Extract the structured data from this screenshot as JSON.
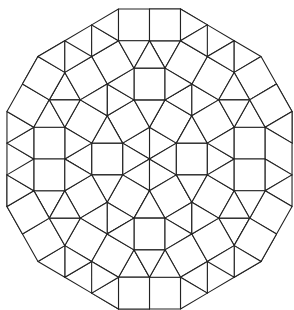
{
  "diagram": {
    "title": "",
    "canvas": {
      "width": 294,
      "height": 310,
      "background": "#ffffff"
    },
    "style": {
      "stroke": "#222222",
      "stroke_width": 1.1,
      "fill": "#ffffff"
    },
    "geometry": {
      "center": [
        149.5,
        159
      ],
      "edge_scale_x": 31,
      "edge_scale_y": 31.7,
      "symmetry_rotations": 6,
      "rotation_step_deg": 60
    },
    "points": {
      "O0": [
        0,
        0
      ],
      "V30": [
        0.866,
        0.5
      ],
      "V90": [
        0,
        1
      ],
      "P": [
        0.5,
        1.866
      ],
      "Pp": [
        -0.5,
        1.866
      ],
      "Q": [
        1.366,
        1.366
      ],
      "S": [
        1.866,
        0.5
      ],
      "H": [
        0.5,
        2.866
      ],
      "Hp": [
        -0.5,
        2.866
      ],
      "O": [
        2.732,
        1
      ],
      "J": [
        2.232,
        1.866
      ],
      "I": [
        1.366,
        2.366
      ],
      "D": [
        1.866,
        3.232
      ],
      "B": [
        1,
        3.732
      ],
      "F": [
        2.732,
        2.732
      ],
      "A": [
        1,
        4.732
      ],
      "T0": [
        0,
        3.732
      ],
      "T0A": [
        0,
        4.732
      ],
      "C": [
        1.866,
        4.232
      ],
      "E": [
        2.732,
        3.732
      ],
      "G": [
        3.598,
        3.232
      ],
      "K": [
        4.098,
        2.366
      ],
      "L": [
        3.232,
        1.866
      ],
      "M": [
        4.598,
        1.5
      ],
      "N": [
        3.732,
        1
      ],
      "T": [
        4.598,
        0.5
      ],
      "Np": [
        3.732,
        0
      ],
      "Op": [
        2.732,
        0
      ]
    },
    "wedge_tiles": [
      {
        "type": "triangle",
        "v": [
          "O0",
          "V30",
          "V90"
        ]
      },
      {
        "type": "square",
        "v": [
          "V90",
          "V30",
          "Q",
          "P"
        ]
      },
      {
        "type": "triangle",
        "v": [
          "V90",
          "P",
          "Pp"
        ]
      },
      {
        "type": "triangle",
        "v": [
          "V30",
          "S",
          "Q"
        ]
      },
      {
        "type": "square",
        "v": [
          "Pp",
          "P",
          "H",
          "Hp"
        ]
      },
      {
        "type": "square",
        "v": [
          "Q",
          "S",
          "O",
          "J"
        ]
      },
      {
        "type": "triangle",
        "v": [
          "P",
          "Q",
          "I"
        ]
      },
      {
        "type": "triangle",
        "v": [
          "H",
          "P",
          "I"
        ]
      },
      {
        "type": "triangle",
        "v": [
          "Q",
          "J",
          "I"
        ]
      },
      {
        "type": "square",
        "v": [
          "H",
          "I",
          "D",
          "B"
        ]
      },
      {
        "type": "square",
        "v": [
          "I",
          "J",
          "F",
          "D"
        ]
      },
      {
        "type": "triangle",
        "v": [
          "T0",
          "B",
          "H"
        ]
      },
      {
        "type": "triangle",
        "v": [
          "T0",
          "H",
          "Hp"
        ]
      },
      {
        "type": "square",
        "v": [
          "T0",
          "B",
          "A",
          "T0A"
        ]
      },
      {
        "type": "triangle",
        "v": [
          "A",
          "B",
          "C"
        ]
      },
      {
        "type": "square",
        "v": [
          "B",
          "D",
          "E",
          "C"
        ]
      },
      {
        "type": "triangle",
        "v": [
          "D",
          "E",
          "F"
        ]
      },
      {
        "type": "triangle",
        "v": [
          "E",
          "F",
          "G"
        ]
      },
      {
        "type": "square",
        "v": [
          "F",
          "G",
          "K",
          "L"
        ]
      },
      {
        "type": "triangle",
        "v": [
          "J",
          "F",
          "L"
        ]
      },
      {
        "type": "square",
        "v": [
          "L",
          "K",
          "M",
          "N"
        ]
      },
      {
        "type": "triangle",
        "v": [
          "J",
          "L",
          "O"
        ]
      },
      {
        "type": "square",
        "v": [
          "O",
          "N",
          "Np",
          "Op"
        ]
      },
      {
        "type": "triangle",
        "v": [
          "N",
          "M",
          "T"
        ]
      },
      {
        "type": "triangle",
        "v": [
          "N",
          "T",
          "Np"
        ]
      },
      {
        "type": "triangle",
        "v": [
          "S",
          "O",
          "Op"
        ]
      }
    ],
    "counts": {
      "boundary_sides": 12,
      "square_sides_edge_count": 2,
      "triangle_sides_edge_count": 3
    }
  }
}
